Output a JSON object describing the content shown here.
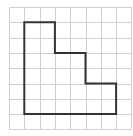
{
  "diagram": {
    "title": "",
    "type": "grid-polygon",
    "grid": {
      "columns": 8,
      "rows": 8,
      "origin_px": [
        9,
        7
      ],
      "cell_px": 15.3,
      "line_color": "#cfcfcf",
      "line_width": 1
    },
    "shape": {
      "name": "staircase-polygon",
      "stroke_color": "#333333",
      "stroke_width": 2,
      "vertices": [
        [
          1,
          1
        ],
        [
          3,
          1
        ],
        [
          3,
          3
        ],
        [
          5,
          3
        ],
        [
          5,
          5
        ],
        [
          7,
          5
        ],
        [
          7,
          7
        ],
        [
          1,
          7
        ]
      ]
    },
    "background": "#ffffff"
  }
}
